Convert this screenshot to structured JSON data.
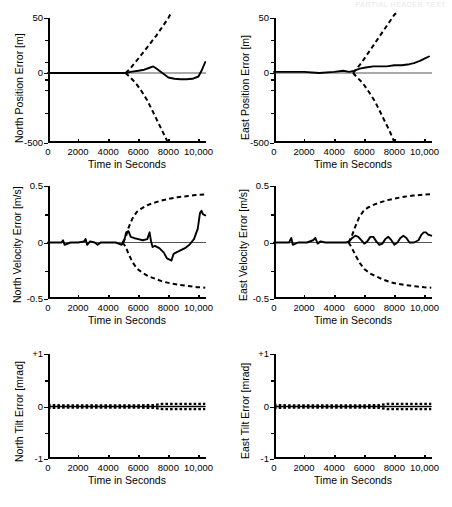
{
  "figure": {
    "header_artifact": "PARTIAL HEADER TEXT",
    "xlabel": "Time in Seconds",
    "x_ticks": [
      "0",
      "2000",
      "4000",
      "6000",
      "8000",
      "10,000"
    ],
    "x_tick_values": [
      0,
      2000,
      4000,
      6000,
      8000,
      10000
    ],
    "xlim": [
      0,
      10500
    ]
  },
  "chart_data": [
    {
      "id": "north-position-error",
      "type": "line",
      "title": "",
      "ylabel": "North Position Error [m]",
      "xlabel": "Time in Seconds",
      "ytick_labels": [
        "50",
        "0",
        "-500"
      ],
      "ytick_values": [
        50,
        0,
        -500
      ],
      "ylim": [
        -500,
        50
      ],
      "y_scale": "nonlinear-compressed",
      "grid": false,
      "legend": "none",
      "series": [
        {
          "name": "error",
          "style": "solid",
          "x": [
            0,
            1000,
            2000,
            3000,
            4000,
            5000,
            5200,
            5500,
            6000,
            6400,
            6800,
            7000,
            7200,
            7600,
            8000,
            8400,
            8800,
            9200,
            9600,
            10000,
            10200,
            10450
          ],
          "y": [
            0,
            0,
            0,
            0,
            0,
            0,
            0,
            1,
            2,
            3,
            5,
            6,
            4,
            0,
            -6,
            -9,
            -10,
            -10,
            -9,
            -4,
            2,
            10
          ]
        },
        {
          "name": "plus-sigma",
          "style": "dashed",
          "x": [
            5150,
            5400,
            5700,
            6000,
            6400,
            6800,
            7200,
            7600,
            8000,
            8200
          ],
          "y": [
            0,
            3,
            8,
            13,
            20,
            27,
            34,
            42,
            50,
            55
          ]
        },
        {
          "name": "minus-sigma",
          "style": "dashed",
          "x": [
            5150,
            5400,
            5800,
            6200,
            6600,
            7000,
            7300,
            7600,
            7900,
            8050
          ],
          "y": [
            0,
            -4,
            -20,
            -55,
            -110,
            -200,
            -280,
            -370,
            -470,
            -520
          ]
        }
      ]
    },
    {
      "id": "east-position-error",
      "type": "line",
      "title": "",
      "ylabel": "East Position Error [m]",
      "xlabel": "Time in Seconds",
      "ytick_labels": [
        "50",
        "0",
        "-500"
      ],
      "ytick_values": [
        50,
        0,
        -500
      ],
      "ylim": [
        -500,
        50
      ],
      "y_scale": "nonlinear-compressed",
      "grid": false,
      "legend": "none",
      "series": [
        {
          "name": "error",
          "style": "solid",
          "x": [
            0,
            1000,
            2000,
            3000,
            4000,
            4600,
            5000,
            5300,
            5700,
            6100,
            6600,
            7000,
            7500,
            8000,
            8500,
            9000,
            9300,
            9700,
            10000,
            10300
          ],
          "y": [
            1,
            1,
            1,
            0,
            1,
            2,
            1,
            2,
            4,
            5,
            6,
            6,
            6,
            7,
            7,
            8,
            9,
            11,
            13,
            15
          ]
        },
        {
          "name": "plus-sigma",
          "style": "dashed",
          "x": [
            5250,
            5500,
            5800,
            6100,
            6500,
            6900,
            7300,
            7700,
            8000,
            8200
          ],
          "y": [
            0,
            4,
            9,
            15,
            23,
            31,
            39,
            47,
            53,
            56
          ]
        },
        {
          "name": "minus-sigma",
          "style": "dashed",
          "x": [
            5250,
            5500,
            5900,
            6300,
            6700,
            7100,
            7400,
            7700,
            7950,
            8100
          ],
          "y": [
            0,
            -5,
            -22,
            -60,
            -115,
            -205,
            -285,
            -375,
            -470,
            -520
          ]
        }
      ]
    },
    {
      "id": "north-velocity-error",
      "type": "line",
      "title": "",
      "ylabel": "North Velocity Error [m/s]",
      "xlabel": "Time in Seconds",
      "ytick_labels": [
        "0.5",
        "0",
        "-0.5"
      ],
      "ytick_values": [
        0.5,
        0,
        -0.5
      ],
      "ylim": [
        -0.5,
        0.5
      ],
      "y_scale": "linear",
      "grid": false,
      "legend": "none",
      "series": [
        {
          "name": "error",
          "style": "solid",
          "x": [
            0,
            400,
            900,
            1000,
            1100,
            1500,
            2000,
            2400,
            2500,
            2600,
            2800,
            3100,
            3300,
            3500,
            4000,
            4500,
            4900,
            5050,
            5200,
            5350,
            5500,
            5700,
            6000,
            6300,
            6600,
            6750,
            6850,
            6950,
            7100,
            7400,
            7700,
            7900,
            8050,
            8200,
            8350,
            8500,
            8800,
            9100,
            9400,
            9700,
            9950,
            10100,
            10200,
            10300,
            10450
          ],
          "y": [
            0,
            0,
            0,
            0.02,
            -0.02,
            0,
            0,
            0.01,
            0.03,
            -0.02,
            0.01,
            0,
            -0.02,
            0,
            0,
            0,
            -0.02,
            0.01,
            0.09,
            0.1,
            0.05,
            0.04,
            0.03,
            0.02,
            0.03,
            0.09,
            0.01,
            -0.04,
            -0.03,
            -0.05,
            -0.09,
            -0.14,
            -0.15,
            -0.16,
            -0.1,
            -0.09,
            -0.07,
            -0.05,
            -0.02,
            0.03,
            0.12,
            0.26,
            0.28,
            0.25,
            0.24
          ]
        },
        {
          "name": "plus-sigma",
          "style": "dashed",
          "x": [
            4950,
            5150,
            5350,
            5600,
            5900,
            6200,
            6600,
            7000,
            7500,
            8000,
            8600,
            9200,
            9800,
            10450
          ],
          "y": [
            0.0,
            0.04,
            0.13,
            0.21,
            0.27,
            0.3,
            0.33,
            0.35,
            0.37,
            0.385,
            0.4,
            0.41,
            0.42,
            0.425
          ]
        },
        {
          "name": "minus-sigma",
          "style": "dashed",
          "x": [
            4950,
            5150,
            5350,
            5600,
            5900,
            6300,
            6700,
            7100,
            7600,
            8100,
            8700,
            9300,
            9900,
            10450
          ],
          "y": [
            0.0,
            -0.035,
            -0.1,
            -0.17,
            -0.23,
            -0.27,
            -0.3,
            -0.32,
            -0.345,
            -0.36,
            -0.375,
            -0.385,
            -0.395,
            -0.4
          ]
        }
      ]
    },
    {
      "id": "east-velocity-error",
      "type": "line",
      "title": "",
      "ylabel": "East Velocity Error [m/s]",
      "xlabel": "Time in Seconds",
      "ytick_labels": [
        "0.5",
        "0",
        "-0.5"
      ],
      "ytick_values": [
        0.5,
        0,
        -0.5
      ],
      "ylim": [
        -0.5,
        0.5
      ],
      "y_scale": "linear",
      "grid": false,
      "legend": "none",
      "series": [
        {
          "name": "error",
          "style": "solid",
          "x": [
            0,
            500,
            1000,
            1150,
            1250,
            1600,
            2200,
            2600,
            2750,
            2900,
            3100,
            3400,
            3800,
            4300,
            4800,
            5000,
            5200,
            5400,
            5600,
            5800,
            6000,
            6200,
            6400,
            6600,
            6800,
            7000,
            7200,
            7400,
            7600,
            7800,
            8000,
            8200,
            8400,
            8600,
            8800,
            9000,
            9300,
            9600,
            9800,
            9950,
            10100,
            10250,
            10450
          ],
          "y": [
            0,
            0,
            0,
            0.04,
            -0.02,
            0,
            0,
            0.02,
            0.04,
            -0.01,
            0.01,
            0,
            0,
            0,
            0,
            0.01,
            0.04,
            0.06,
            0.05,
            0.02,
            -0.01,
            0.01,
            0.05,
            0.05,
            0.01,
            -0.02,
            -0.01,
            0.03,
            0.05,
            0.02,
            -0.02,
            0,
            0.04,
            0.06,
            0.04,
            0,
            0,
            0.02,
            0.07,
            0.09,
            0.09,
            0.07,
            0.06
          ]
        },
        {
          "name": "plus-sigma",
          "style": "dashed",
          "x": [
            4950,
            5150,
            5400,
            5650,
            5950,
            6250,
            6650,
            7050,
            7550,
            8050,
            8650,
            9250,
            9850,
            10450
          ],
          "y": [
            0.0,
            0.05,
            0.14,
            0.22,
            0.28,
            0.31,
            0.335,
            0.355,
            0.375,
            0.39,
            0.405,
            0.415,
            0.422,
            0.427
          ]
        },
        {
          "name": "minus-sigma",
          "style": "dashed",
          "x": [
            4950,
            5150,
            5400,
            5700,
            6000,
            6400,
            6800,
            7200,
            7700,
            8200,
            8800,
            9400,
            10000,
            10450
          ],
          "y": [
            0.0,
            -0.04,
            -0.11,
            -0.18,
            -0.235,
            -0.275,
            -0.3,
            -0.325,
            -0.35,
            -0.365,
            -0.378,
            -0.388,
            -0.396,
            -0.4
          ]
        }
      ]
    },
    {
      "id": "north-tilt-error",
      "type": "line",
      "title": "",
      "ylabel": "North Tilt Error [mrad]",
      "xlabel": "Time in Seconds",
      "ytick_labels": [
        "+1",
        "0",
        "-1"
      ],
      "ytick_values": [
        1,
        0,
        -1
      ],
      "ylim": [
        -1,
        1
      ],
      "y_scale": "linear",
      "grid": false,
      "legend": "none",
      "series": [
        {
          "name": "error",
          "style": "solid",
          "x": [
            0,
            2000,
            4000,
            6000,
            8000,
            10450
          ],
          "y": [
            0,
            0,
            0,
            0,
            0,
            0
          ]
        },
        {
          "name": "plus-sigma",
          "style": "dashed",
          "x": [
            0,
            1000,
            3000,
            5000,
            7000,
            7600,
            8500,
            9500,
            10450
          ],
          "y": [
            0.03,
            0.02,
            0.02,
            0.02,
            0.025,
            0.05,
            0.05,
            0.05,
            0.05
          ]
        },
        {
          "name": "minus-sigma",
          "style": "dashed",
          "x": [
            0,
            1000,
            3000,
            5000,
            7000,
            7600,
            8500,
            9500,
            10450
          ],
          "y": [
            -0.03,
            -0.02,
            -0.02,
            -0.02,
            -0.025,
            -0.05,
            -0.05,
            -0.05,
            -0.05
          ]
        }
      ]
    },
    {
      "id": "east-tilt-error",
      "type": "line",
      "title": "",
      "ylabel": "East Tilt Error [mrad]",
      "xlabel": "Time in Seconds",
      "ytick_labels": [
        "+1",
        "0",
        "-1"
      ],
      "ytick_values": [
        1,
        0,
        -1
      ],
      "ylim": [
        -1,
        1
      ],
      "y_scale": "linear",
      "grid": false,
      "legend": "none",
      "series": [
        {
          "name": "error",
          "style": "solid",
          "x": [
            0,
            2000,
            4000,
            6000,
            8000,
            10450
          ],
          "y": [
            0,
            0,
            0,
            0,
            0,
            0
          ]
        },
        {
          "name": "plus-sigma",
          "style": "dashed",
          "x": [
            0,
            1000,
            3000,
            5000,
            7000,
            7500,
            8500,
            9500,
            10450
          ],
          "y": [
            0.03,
            0.02,
            0.02,
            0.02,
            0.025,
            0.05,
            0.05,
            0.05,
            0.05
          ]
        },
        {
          "name": "minus-sigma",
          "style": "dashed",
          "x": [
            0,
            1000,
            3000,
            5000,
            7000,
            7500,
            8500,
            9500,
            10450
          ],
          "y": [
            -0.03,
            -0.02,
            -0.02,
            -0.02,
            -0.025,
            -0.05,
            -0.05,
            -0.05,
            -0.05
          ]
        }
      ]
    }
  ]
}
